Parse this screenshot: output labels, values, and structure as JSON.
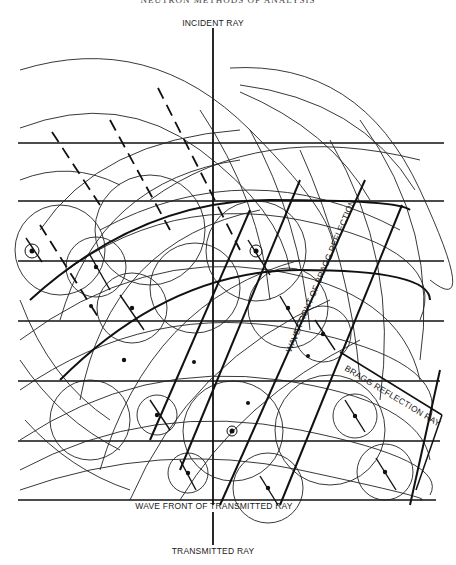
{
  "header": {
    "partial_title": "NEUTRON METHODS OF ANALYSIS"
  },
  "labels": {
    "incident_ray": "INCIDENT RAY",
    "transmitted_ray": "TRANSMITTED RAY",
    "wave_front_transmitted": "WAVE FRONT OF TRANSMITTED RAY",
    "wave_front_bragg": "WAVE FRONT OF BRAGG REFLECTION",
    "bragg_reflection_ray": "BRAGG REFLECTION RAY"
  },
  "geometry": {
    "axis_x": 213,
    "plane_lines_y": [
      143,
      201,
      261,
      321,
      381,
      441,
      500
    ],
    "plane_x_start": 18,
    "plane_x_end": 444,
    "scatter_centers": [
      [
        32,
        251
      ],
      [
        96,
        267
      ],
      [
        256,
        251
      ],
      [
        132,
        308
      ],
      [
        195,
        288
      ],
      [
        288,
        308
      ],
      [
        323,
        334
      ],
      [
        157,
        415
      ],
      [
        233,
        431
      ],
      [
        355,
        416
      ],
      [
        188,
        473
      ],
      [
        268,
        488
      ],
      [
        385,
        472
      ],
      [
        90,
        300
      ],
      [
        122,
        352
      ],
      [
        148,
        392
      ]
    ],
    "color_line": "#111111"
  }
}
